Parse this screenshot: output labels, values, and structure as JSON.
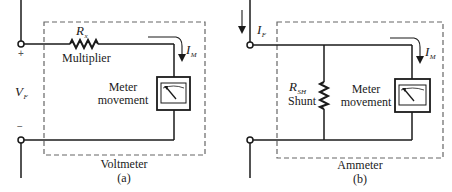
{
  "diagram": {
    "panels": [
      {
        "id": "a",
        "caption": "Voltmeter",
        "panel_label": "(a)",
        "resistor": {
          "symbol": "R",
          "subscript": "x",
          "name": "Multiplier"
        },
        "meter": {
          "label_line1": "Meter",
          "label_line2": "movement"
        },
        "current": {
          "symbol": "I",
          "subscript": "M"
        },
        "voltage": {
          "symbol": "V",
          "subscript": "F"
        },
        "terminal_plus": "+",
        "terminal_minus": "−"
      },
      {
        "id": "b",
        "caption": "Ammeter",
        "panel_label": "(b)",
        "resistor": {
          "symbol": "R",
          "subscript": "SH",
          "name": "Shunt"
        },
        "meter": {
          "label_line1": "Meter",
          "label_line2": "movement"
        },
        "current": {
          "symbol": "I",
          "subscript": "M"
        },
        "input_current": {
          "symbol": "I",
          "subscript": "F"
        }
      }
    ],
    "colors": {
      "line": "#1a1a1a",
      "dashed_box": "#555555",
      "background": "#ffffff"
    }
  }
}
